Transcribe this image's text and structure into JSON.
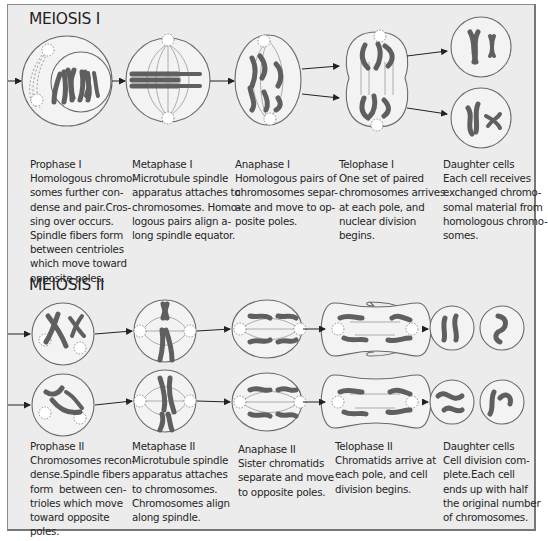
{
  "meiosis1": {
    "title": "MEIOSIS I",
    "stages": [
      {
        "name": "Prophase I",
        "lines": [
          "Homologous chromo-",
          "somes further con-",
          "dense and pair.Cros-",
          "sing over occurs.",
          "Spindle fibers form",
          "between centrioles",
          "which move toward",
          "opposite poles."
        ]
      },
      {
        "name": "Metaphase I",
        "lines": [
          "Microtubule spindle",
          "apparatus attaches to",
          "chromosomes. Homo-",
          "logous pairs align a-",
          "long spindle equator."
        ]
      },
      {
        "name": "Anaphase I",
        "lines": [
          "Homologous pairs of",
          "chromosomes separ-",
          "ate and move to op-",
          "posite poles."
        ]
      },
      {
        "name": "Telophase I",
        "lines": [
          "One set of paired",
          "chromosomes arrives",
          "at each pole, and",
          "nuclear division",
          "begins."
        ]
      },
      {
        "name": "Daughter cells",
        "lines": [
          "Each cell receives",
          "exchanged chromo-",
          "somal material from",
          "homologous chromo-",
          "somes."
        ]
      }
    ]
  },
  "meiosis2": {
    "title": "MEIOSIS II",
    "stages": [
      {
        "name": "Prophase II",
        "lines": [
          "Chromosomes recon-",
          "dense.Spindle fibers",
          "form  between cen-",
          "trioles which move",
          "toward opposite",
          "poles."
        ]
      },
      {
        "name": "Metaphase II",
        "lines": [
          "Microtubule spindle",
          "apparatus attaches",
          "to chromosomes.",
          "Chromosomes align",
          "along spindle."
        ]
      },
      {
        "name": "Anaphase II",
        "lines": [
          "Sister chromatids",
          "separate and move",
          "to opposite poles."
        ]
      },
      {
        "name": "Telophase II",
        "lines": [
          "Chromatids arrive at",
          "each pole, and cell",
          "division begins."
        ]
      },
      {
        "name": "Daughter cells",
        "lines": [
          "Cell division com-",
          "plete.Each cell",
          "ends up with half",
          "the original number",
          "of chromosomes."
        ]
      }
    ]
  },
  "colors": {
    "background": "#ececec",
    "cell_fill": "#f3f3f3",
    "cell_outline": "#6a6a6a",
    "chromosome": "#5f5f5f",
    "text": "#262626"
  }
}
